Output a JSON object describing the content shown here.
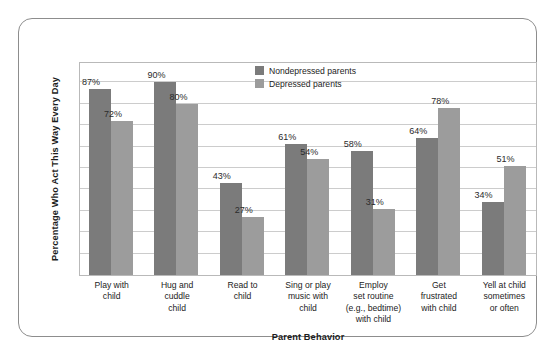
{
  "chart_data": {
    "type": "bar",
    "title": "",
    "xlabel": "Parent Behavior",
    "ylabel": "Percentage Who Act This Way Every Day",
    "ylim": [
      0,
      100
    ],
    "grid": true,
    "grid_interval": 10,
    "y_tick_labels_visible": false,
    "legend_position": "top-center",
    "categories": [
      "Play with child",
      "Hug and cuddle child",
      "Read to child",
      "Sing or play music with child",
      "Employ set routine (e.g., bedtime) with child",
      "Get frustrated with child",
      "Yell at child sometimes or often"
    ],
    "category_lines": [
      [
        "Play with",
        "child"
      ],
      [
        "Hug and",
        "cuddle",
        "child"
      ],
      [
        "Read to",
        "child"
      ],
      [
        "Sing or play",
        "music with",
        "child"
      ],
      [
        "Employ",
        "set routine",
        "(e.g., bedtime)",
        "with child"
      ],
      [
        "Get",
        "frustrated",
        "with child"
      ],
      [
        "Yell at child",
        "sometimes",
        "or often"
      ]
    ],
    "series": [
      {
        "name": "Nondepressed parents",
        "color": "#7b7b7b",
        "values": [
          87,
          90,
          43,
          61,
          58,
          64,
          34
        ],
        "value_labels": [
          "87%",
          "90%",
          "43%",
          "61%",
          "58%",
          "64%",
          "34%"
        ]
      },
      {
        "name": "Depressed parents",
        "color": "#9c9c9c",
        "values": [
          72,
          80,
          27,
          54,
          31,
          78,
          51
        ],
        "value_labels": [
          "72%",
          "80%",
          "27%",
          "54%",
          "31%",
          "78%",
          "51%"
        ]
      }
    ]
  },
  "colors": {
    "series_nondepressed": "#7b7b7b",
    "series_depressed": "#9c9c9c",
    "gridline": "#cccccc",
    "plot_border": "#b9b9b9",
    "frame_border": "#8d8d8d",
    "text": "#1c1c1c",
    "background": "#ffffff"
  }
}
